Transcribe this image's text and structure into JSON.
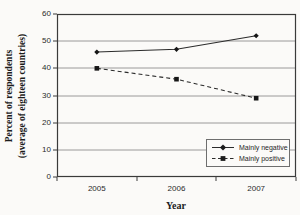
{
  "figure": {
    "background": "#fbfaf8"
  },
  "chart_data": {
    "type": "line",
    "categories": [
      "2005",
      "2006",
      "2007"
    ],
    "series": [
      {
        "name": "Mainly negative",
        "values": [
          46,
          47,
          52
        ],
        "line_style": "solid",
        "marker": "diamond",
        "color": "#2b2b2b"
      },
      {
        "name": "Mainly positive",
        "values": [
          40,
          36,
          29
        ],
        "line_style": "dashed",
        "marker": "square",
        "color": "#2b2b2b"
      }
    ],
    "title": "",
    "xlabel": "Year",
    "ylabel": "Percent of respondents (average of eighteen countries)",
    "ylabel_line1": "Percent of respondents",
    "ylabel_line2": "(average of eighteen countries)",
    "ylim": [
      0,
      60
    ],
    "y_ticks": [
      0,
      10,
      20,
      30,
      40,
      50,
      60
    ],
    "grid": "horizontal",
    "gridline_color": "#8f8f8f",
    "axis_color": "#3a3a3a",
    "legend_position": "inside-bottom-right"
  }
}
